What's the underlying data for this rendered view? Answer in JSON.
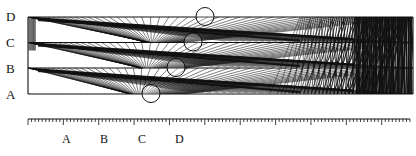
{
  "figure": {
    "row_labels": [
      "D",
      "C",
      "B",
      "A"
    ],
    "axis_labels": [
      "A",
      "B",
      "C",
      "D"
    ],
    "circle_markers": [
      "D",
      "C",
      "B",
      "A"
    ],
    "ruler": {
      "minor_ticks_per_major": 10,
      "major_tick_count": 11
    },
    "colors": {
      "ink": "#111111",
      "background": "#ffffff"
    }
  }
}
